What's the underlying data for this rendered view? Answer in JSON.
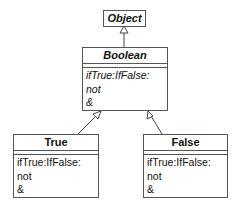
{
  "diagram": {
    "type": "uml-class-hierarchy",
    "classes": [
      {
        "id": "object",
        "name": "Object",
        "abstract": true,
        "operations": []
      },
      {
        "id": "boolean",
        "name": "Boolean",
        "abstract": true,
        "operations": [
          "ifTrue:IfFalse:",
          "not",
          "&"
        ]
      },
      {
        "id": "true",
        "name": "True",
        "abstract": false,
        "operations": [
          "ifTrue:IfFalse:",
          "not",
          "&"
        ]
      },
      {
        "id": "false",
        "name": "False",
        "abstract": false,
        "operations": [
          "ifTrue:IfFalse:",
          "not",
          "&"
        ]
      }
    ],
    "relations": [
      {
        "from": "Boolean",
        "to": "Object",
        "kind": "generalization"
      },
      {
        "from": "True",
        "to": "Boolean",
        "kind": "generalization"
      },
      {
        "from": "False",
        "to": "Boolean",
        "kind": "generalization"
      }
    ]
  },
  "object": {
    "name": "Object"
  },
  "boolean": {
    "name": "Boolean",
    "ops": [
      "ifTrue:IfFalse:",
      "not",
      "&"
    ]
  },
  "true_class": {
    "name": "True",
    "ops": [
      "ifTrue:IfFalse:",
      "not",
      "&"
    ]
  },
  "false_class": {
    "name": "False",
    "ops": [
      "ifTrue:IfFalse:",
      "not",
      "&"
    ]
  }
}
